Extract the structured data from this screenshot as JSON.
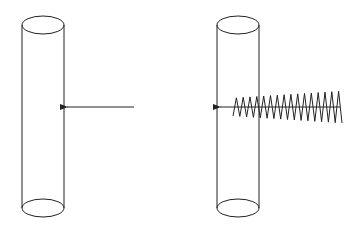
{
  "diagram": {
    "colors": {
      "stroke": "#222222",
      "background": "#ffffff"
    },
    "panels": [
      {
        "id": "left",
        "cylinder": {
          "x_left": 22,
          "x_right": 64,
          "top_cy": 25,
          "bottom_cy": 208,
          "ry": 9
        },
        "arrow": {
          "x_start": 134,
          "x_end": 67,
          "y": 107,
          "style": "plain"
        }
      },
      {
        "id": "right",
        "cylinder": {
          "x_left": 217,
          "x_right": 259,
          "top_cy": 25,
          "bottom_cy": 208,
          "ry": 9
        },
        "arrow": {
          "x_start": 340,
          "x_end": 220,
          "y": 107,
          "style": "zigzag"
        },
        "zigzag": {
          "x_start": 233,
          "x_end": 342,
          "center_y": 107,
          "amp_start": 9,
          "amp_end": 16,
          "cycles": 16
        }
      }
    ]
  }
}
